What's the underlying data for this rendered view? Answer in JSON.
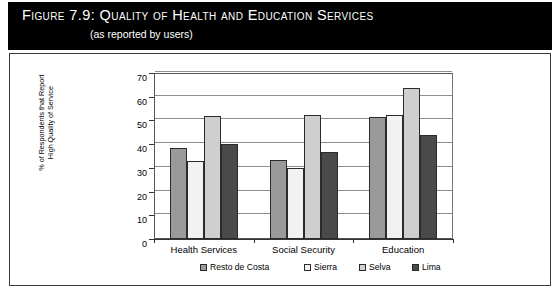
{
  "figure": {
    "number_label": "Figure 7.9:",
    "title": "Quality of Health and Education Services",
    "subtitle": "(as reported by users)"
  },
  "chart_data": {
    "type": "bar",
    "title": "Quality of Health and Education Services",
    "subtitle": "(as reported by users)",
    "xlabel": "",
    "ylabel": "% of Respondents that Report\nHigh Quality of Service",
    "ylim": [
      0,
      70
    ],
    "ytick_step": 10,
    "yticks": [
      0,
      10,
      20,
      30,
      40,
      50,
      60,
      70
    ],
    "ytick_labels": [
      "0",
      "10",
      "20",
      "30",
      "40",
      "50",
      "60",
      "70"
    ],
    "grid": "horizontal",
    "legend_position": "bottom",
    "categories": [
      "Health Services",
      "Social Security",
      "Education"
    ],
    "series": [
      {
        "name": "Resto de Costa",
        "color": "#9a9a9a",
        "values": [
          38.5,
          33.5,
          51.5
        ]
      },
      {
        "name": "Sierra",
        "color": "#f2f2f2",
        "values": [
          33.0,
          30.0,
          52.5
        ]
      },
      {
        "name": "Selva",
        "color": "#cfcfcf",
        "values": [
          52.0,
          52.5,
          63.5
        ]
      },
      {
        "name": "Lima",
        "color": "#4a4a4a",
        "values": [
          40.0,
          36.5,
          44.0
        ]
      }
    ]
  },
  "colors": {
    "banner_background": "#000000",
    "banner_text": "#ffffff",
    "frame_border": "#3a3a3a",
    "plot_background": "#ffffff",
    "gridline": "#8d8d8d",
    "axis": "#333333"
  }
}
